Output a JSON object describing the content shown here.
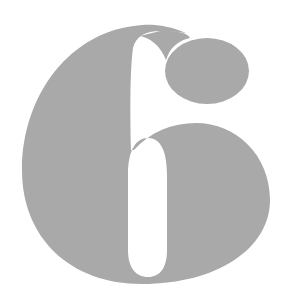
{
  "figure": {
    "glyph": "6",
    "colors": {
      "background": "#ffffff",
      "glyph_fill": "#a9a9a9"
    }
  }
}
